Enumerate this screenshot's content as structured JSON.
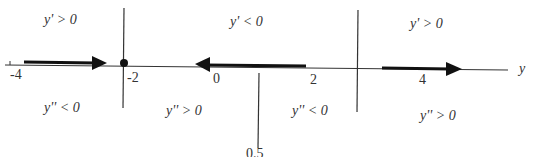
{
  "diagram": {
    "axis_label": "y",
    "ticks": [
      {
        "label": "-4",
        "value": -4
      },
      {
        "label": "-2",
        "value": -2
      },
      {
        "label": "0",
        "value": 0
      },
      {
        "label": "2",
        "value": 2
      },
      {
        "label": "4",
        "value": 4
      },
      {
        "label": "0.5",
        "value": 0.5
      }
    ],
    "top_regions": [
      "y' > 0",
      "y' < 0",
      "y' > 0"
    ],
    "bottom_regions": [
      "y'' < 0",
      "y'' > 0",
      "y'' < 0",
      "y'' > 0"
    ],
    "equilibrium": {
      "value": -2,
      "marker": "filled-dot"
    },
    "arrows": [
      {
        "from": -4,
        "to": -2,
        "direction": "right"
      },
      {
        "from": 2,
        "to": 0,
        "direction": "left"
      },
      {
        "from": 3,
        "to": 4.5,
        "direction": "right"
      }
    ],
    "colors": {
      "line": "#333333"
    }
  }
}
